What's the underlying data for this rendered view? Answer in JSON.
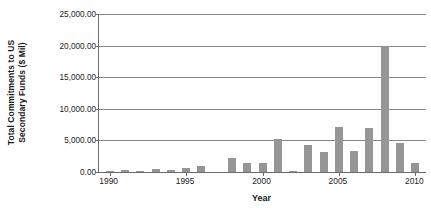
{
  "chart_data": {
    "type": "bar",
    "title": "",
    "xlabel": "Year",
    "ylabel": "Total Commitments to US Secondary Funds ($ Mil)",
    "ylabel_line1": "Total Commitments to US",
    "ylabel_line2": "Secondary Funds ($ Mil)",
    "ylim": [
      0,
      25000
    ],
    "xlim": [
      1989.3,
      2010.7
    ],
    "grid": true,
    "legend": false,
    "bar_color": "#969696",
    "axis_color": "#6b6b6b",
    "gridline_color": "#878787",
    "ytick_values": [
      0,
      5000,
      10000,
      15000,
      20000,
      25000
    ],
    "ytick_labels": [
      "0.00",
      "5,000.00",
      "10,000.00",
      "15,000.00",
      "20,000.00",
      "25,000.00"
    ],
    "xtick_values": [
      1990,
      1995,
      2000,
      2005,
      2010
    ],
    "xtick_labels": [
      "1990",
      "1995",
      "2000",
      "2005",
      "2010"
    ],
    "categories": [
      1990,
      1991,
      1992,
      1993,
      1994,
      1995,
      1996,
      1997,
      1998,
      1999,
      2000,
      2001,
      2002,
      2003,
      2004,
      2005,
      2006,
      2007,
      2008,
      2009,
      2010
    ],
    "values": [
      40,
      330,
      60,
      420,
      310,
      600,
      1000,
      0,
      2150,
      1500,
      1500,
      5300,
      80,
      4200,
      3200,
      7200,
      3300,
      7000,
      20000,
      4600,
      1350
    ]
  }
}
